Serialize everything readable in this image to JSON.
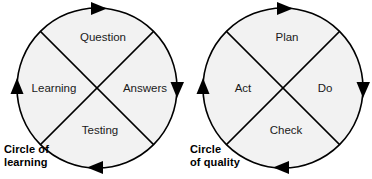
{
  "figure": {
    "background_color": "#ffffff",
    "circle_fill_color": "#f2f2f2",
    "stroke_color": "#000000",
    "label_color": "#1a1a1a",
    "rotation_direction": "clockwise"
  },
  "diagrams": [
    {
      "id": "circle-of-learning",
      "caption_line_1": "Circle of",
      "caption_line_2": "learning",
      "center_x": 97,
      "center_y": 88,
      "radius": 80,
      "quadrants": [
        {
          "position": "top",
          "label": "Question"
        },
        {
          "position": "right",
          "label": "Answers"
        },
        {
          "position": "bottom",
          "label": "Testing"
        },
        {
          "position": "left",
          "label": "Learning"
        }
      ],
      "arrows": [
        {
          "position": "top",
          "points": "right"
        },
        {
          "position": "right",
          "points": "down"
        },
        {
          "position": "bottom",
          "points": "left"
        },
        {
          "position": "left",
          "points": "up"
        }
      ]
    },
    {
      "id": "circle-of-quality",
      "caption_line_1": "Circle",
      "caption_line_2": "of quality",
      "center_x": 283,
      "center_y": 88,
      "radius": 80,
      "quadrants": [
        {
          "position": "top",
          "label": "Plan"
        },
        {
          "position": "right",
          "label": "Do"
        },
        {
          "position": "bottom",
          "label": "Check"
        },
        {
          "position": "left",
          "label": "Act"
        }
      ],
      "arrows": [
        {
          "position": "top",
          "points": "right"
        },
        {
          "position": "right",
          "points": "down"
        },
        {
          "position": "bottom",
          "points": "left"
        },
        {
          "position": "left",
          "points": "up"
        }
      ]
    }
  ]
}
